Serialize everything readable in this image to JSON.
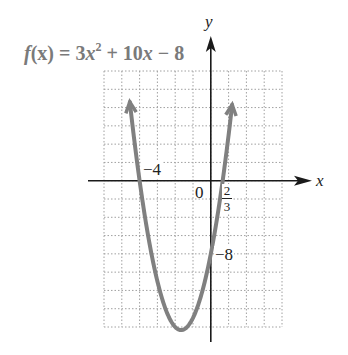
{
  "chart_data": {
    "type": "line",
    "title_parts": {
      "f": "f",
      "x1": "(x)",
      "eq": " = 3",
      "x2": "x",
      "exp": "2",
      "rest1": " + 10",
      "x3": "x",
      "rest2": " − 8"
    },
    "xlabel": "x",
    "ylabel": "y",
    "xlim": [
      -6,
      4
    ],
    "ylim": [
      -16,
      12
    ],
    "grid": true,
    "grid_x_step": 1,
    "grid_y_step": 2,
    "function": "3x^2 + 10x - 8",
    "series": [
      {
        "name": "f(x)",
        "color": "#808080",
        "x": [
          -4.55,
          -4,
          -3,
          -2,
          -1.667,
          -1,
          0,
          0.6667,
          1,
          1.2
        ],
        "y": [
          11.6,
          0,
          -11,
          -16,
          -16.33,
          -15,
          -8,
          0,
          5,
          8.3
        ]
      }
    ],
    "annotations": [
      {
        "text": "−4",
        "x": -4,
        "y": 0,
        "meaning": "x-intercept"
      },
      {
        "text": "2/3",
        "x": 0.6667,
        "y": 0,
        "meaning": "x-intercept"
      },
      {
        "text": "−8",
        "x": 0,
        "y": -8,
        "meaning": "y-intercept"
      },
      {
        "text": "0",
        "x": 0,
        "y": 0,
        "meaning": "origin"
      }
    ],
    "vertex": {
      "x": -1.667,
      "y": -16.33
    }
  },
  "labels": {
    "x_axis": "x",
    "y_axis": "y",
    "origin": "0",
    "x_intercept_left": "−4",
    "x_intercept_right_num": "2",
    "x_intercept_right_den": "3",
    "y_intercept": "−8"
  },
  "colors": {
    "curve": "#808080",
    "axis": "#1a1a1a",
    "grid": "#a0a0a0",
    "title": "#7a7a7a"
  }
}
